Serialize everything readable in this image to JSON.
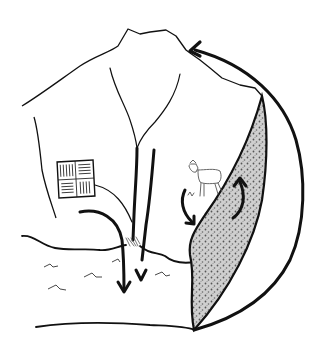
{
  "diagram": {
    "type": "hand-drawn watershed sketch",
    "background": "#ffffff",
    "ink": "#111111",
    "stipple_fill": "#b8b8b8",
    "elements": [
      {
        "name": "mountain-ridge",
        "description": "hilltop outline forming watershed boundary"
      },
      {
        "name": "streams",
        "description": "two streams converging in the valley"
      },
      {
        "name": "farm-field",
        "description": "square field with crop rows"
      },
      {
        "name": "goat",
        "description": "grazing animal on slope"
      },
      {
        "name": "wetland-band",
        "description": "stippled riparian/forest band along right slope"
      },
      {
        "name": "lake",
        "description": "water body with wave marks at bottom"
      },
      {
        "name": "cycle-arrow",
        "description": "large arrow looping from the wetland back to the mountain top"
      },
      {
        "name": "runoff-arrows",
        "description": "arrows showing flow from farm and streams into lake"
      },
      {
        "name": "animal-arrows",
        "description": "arrows showing movement between goat area and wetland"
      }
    ]
  }
}
